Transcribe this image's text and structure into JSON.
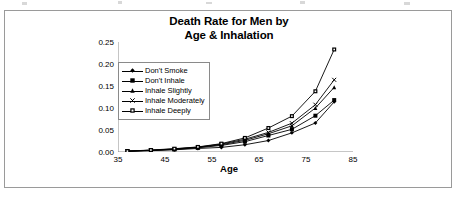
{
  "chart_data": {
    "type": "line",
    "title": "Death Rate for Men by Age & Inhalation",
    "title_line1": "Death Rate for Men by",
    "title_line2": "Age & Inhalation",
    "xlabel": "Age",
    "ylabel": "Death Rate",
    "xlim": [
      35,
      85
    ],
    "ylim": [
      0.0,
      0.25
    ],
    "xticks": [
      35,
      45,
      55,
      65,
      75,
      85
    ],
    "xtick_labels": [
      "35",
      "45",
      "55",
      "65",
      "75",
      "85"
    ],
    "yticks": [
      0.0,
      0.05,
      0.1,
      0.15,
      0.2,
      0.25
    ],
    "ytick_labels": [
      "0.00",
      "0.05",
      "0.10",
      "0.15",
      "0.20",
      "0.25"
    ],
    "grid": false,
    "legend_position": "upper left inside",
    "x": [
      37,
      42,
      47,
      52,
      57,
      62,
      67,
      72,
      77,
      81
    ],
    "series": [
      {
        "name": "Don't Smoke",
        "marker": "diamond",
        "color": "#000000",
        "values": [
          0.0015,
          0.003,
          0.005,
          0.008,
          0.0105,
          0.0165,
          0.026,
          0.0435,
          0.066,
          0.114
        ]
      },
      {
        "name": "Don't Inhale",
        "marker": "square",
        "color": "#000000",
        "values": [
          0.002,
          0.0035,
          0.006,
          0.0095,
          0.015,
          0.0235,
          0.0375,
          0.0515,
          0.0825,
          0.118
        ]
      },
      {
        "name": "Inhale Slightly",
        "marker": "triangle",
        "color": "#000000",
        "values": [
          0.002,
          0.004,
          0.0065,
          0.0105,
          0.0165,
          0.0265,
          0.0415,
          0.0595,
          0.1,
          0.147
        ]
      },
      {
        "name": "Inhale Moderately",
        "marker": "cross",
        "color": "#000000",
        "values": [
          0.002,
          0.004,
          0.007,
          0.011,
          0.018,
          0.029,
          0.0445,
          0.0655,
          0.1075,
          0.164
        ]
      },
      {
        "name": "Inhale Deeply",
        "marker": "dotted-square",
        "color": "#000000",
        "values": [
          0.002,
          0.0045,
          0.0075,
          0.0115,
          0.019,
          0.032,
          0.0545,
          0.0815,
          0.138,
          0.233
        ]
      }
    ]
  }
}
